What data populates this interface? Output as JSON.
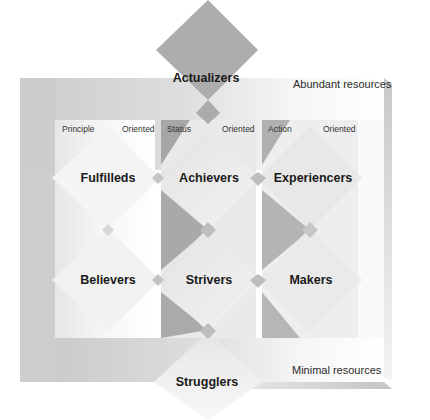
{
  "diagram": {
    "type": "segmentation-framework",
    "resource_labels": {
      "top": "Abundant resources",
      "bottom": "Minimal resources"
    },
    "top_segment": "Actualizers",
    "bottom_segment": "Strugglers",
    "orientations": [
      {
        "left": "Principle",
        "right": "Oriented"
      },
      {
        "left": "Status",
        "right": "Oriented"
      },
      {
        "left": "Action",
        "right": "Oriented"
      }
    ],
    "segments": {
      "row1": [
        "Fulfilleds",
        "Achievers",
        "Experiencers"
      ],
      "row2": [
        "Believers",
        "Strivers",
        "Makers"
      ]
    },
    "colors": {
      "frame_gray": "#cfcfcf",
      "dark_wedge": "#a8a8a8",
      "actualizers": "#adadad",
      "light_diamond": "#ececec",
      "connector": "#bdbdbd"
    }
  }
}
